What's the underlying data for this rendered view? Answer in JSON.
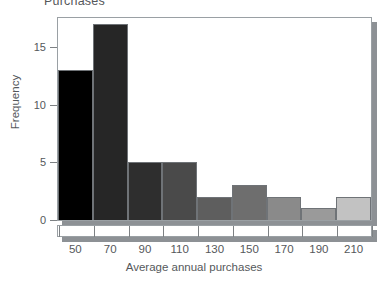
{
  "title": {
    "text": "Purchases",
    "cropped": true
  },
  "chart_data": {
    "type": "bar",
    "title": "Purchases",
    "xlabel": "Average annual purchases",
    "ylabel": "Frequency",
    "categories": [
      "50",
      "70",
      "90",
      "110",
      "130",
      "150",
      "170",
      "190",
      "210"
    ],
    "values": [
      13,
      17,
      5,
      5,
      2,
      3,
      2,
      1,
      2
    ],
    "bin_edges": [
      40,
      60,
      80,
      100,
      120,
      140,
      160,
      180,
      200,
      220
    ],
    "bin_width": 20,
    "ylim": [
      0,
      17.5
    ],
    "xlim": [
      40,
      220
    ],
    "yticks": [
      0,
      5,
      10,
      15
    ],
    "ytick_labels": [
      "0",
      "5",
      "10",
      "15"
    ],
    "xtick_labels": [
      "50",
      "70",
      "90",
      "110",
      "130",
      "150",
      "170",
      "190",
      "210"
    ],
    "grid": false,
    "legend": false,
    "bar_colors": [
      "#000000",
      "#262626",
      "#2e2e2e",
      "#4a4a4a",
      "#5e5e5e",
      "#6e6e6e",
      "#8a8a8a",
      "#9a9a9a",
      "#c2c2c2"
    ],
    "bar_edge_color": "#6f7377",
    "frame_color": "#9aa0a4",
    "shadow_color": "#8d9195",
    "text_color": "#55585b"
  }
}
